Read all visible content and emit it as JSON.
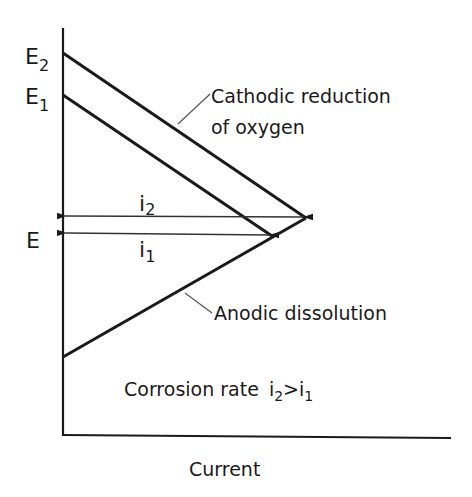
{
  "diagram": {
    "type": "Evans diagram (potential vs current)",
    "axes": {
      "x_label": "Current",
      "y_labels": [
        "E2",
        "E1",
        "E"
      ]
    },
    "labels": {
      "E2_main": "E",
      "E2_sub": "2",
      "E1_main": "E",
      "E1_sub": "1",
      "E": "E",
      "i2_main": "i",
      "i2_sub": "2",
      "i1_main": "i",
      "i1_sub": "1",
      "cathodic_line1": "Cathodic reduction",
      "cathodic_line2": "of oxygen",
      "anodic": "Anodic dissolution",
      "rate_text": "Corrosion rate",
      "rate_i2": "i",
      "rate_i2_sub": "2",
      "rate_gt": ">",
      "rate_i1": "i",
      "rate_i1_sub": "1",
      "x_axis": "Current"
    },
    "lines": [
      {
        "name": "cathodic-E2",
        "from": [
          63,
          53
        ],
        "to": [
          306,
          218
        ]
      },
      {
        "name": "cathodic-E1",
        "from": [
          63,
          95
        ],
        "to": [
          272,
          236
        ]
      },
      {
        "name": "anodic",
        "from": [
          63,
          357
        ],
        "to": [
          306,
          218
        ]
      }
    ],
    "arrows": [
      {
        "name": "i2",
        "y": 216,
        "x_end": 306
      },
      {
        "name": "i1",
        "y": 233,
        "x_end": 272
      }
    ],
    "colors": {
      "ink": "#1a1a1a",
      "background": "#ffffff"
    }
  }
}
